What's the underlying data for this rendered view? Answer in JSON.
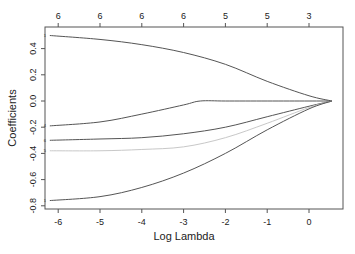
{
  "chart_data": {
    "type": "line",
    "title": "",
    "xlabel": "Log Lambda",
    "ylabel": "Coefficients",
    "xlim": [
      -6.3,
      0.8
    ],
    "ylim": [
      -0.82,
      0.57
    ],
    "grid": false,
    "legend": null,
    "x_ticks": [
      -6,
      -5,
      -4,
      -3,
      -2,
      -1,
      0
    ],
    "x_tick_labels": [
      "-6",
      "-5",
      "-4",
      "-3",
      "-2",
      "-1",
      "0"
    ],
    "y_ticks": [
      -0.8,
      -0.6,
      -0.4,
      -0.2,
      0.0,
      0.2,
      0.4
    ],
    "y_tick_labels": [
      "-0.8",
      "-0.6",
      "-0.4",
      "-0.2",
      "0.0",
      "0.2",
      "0.4"
    ],
    "top_axis": {
      "positions": [
        -6,
        -5,
        -4,
        -3,
        -2,
        -1,
        0
      ],
      "labels": [
        "6",
        "6",
        "6",
        "6",
        "5",
        "5",
        "3"
      ],
      "meaning": "number of nonzero coefficients"
    },
    "series": [
      {
        "name": "1",
        "color": "#555555",
        "x": [
          -6.2,
          -5,
          -4,
          -3,
          -2,
          -1,
          0,
          0.55
        ],
        "values": [
          0.5,
          0.47,
          0.43,
          0.37,
          0.28,
          0.15,
          0.04,
          0.0
        ]
      },
      {
        "name": "4",
        "color": "#555555",
        "x": [
          -6.2,
          -5,
          -4,
          -3,
          -2.6,
          -2,
          -1,
          0,
          0.55
        ],
        "values": [
          -0.19,
          -0.16,
          -0.1,
          -0.03,
          0.0,
          0.0,
          0.0,
          0.0,
          0.0
        ]
      },
      {
        "name": "6",
        "color": "#555555",
        "x": [
          -6.2,
          -5,
          -4,
          -3,
          -2,
          -1,
          0,
          0.55
        ],
        "values": [
          -0.3,
          -0.29,
          -0.28,
          -0.25,
          -0.2,
          -0.12,
          -0.04,
          0.0
        ]
      },
      {
        "name": "5",
        "color": "#c8c8c8",
        "x": [
          -6.2,
          -5,
          -4,
          -3,
          -2,
          -1,
          0,
          0.55
        ],
        "values": [
          -0.38,
          -0.38,
          -0.37,
          -0.35,
          -0.28,
          -0.17,
          -0.05,
          0.0
        ]
      },
      {
        "name": "1",
        "color": "#555555",
        "x": [
          -6.2,
          -5,
          -4,
          -3,
          -2,
          -1,
          0,
          0.55
        ],
        "values": [
          -0.76,
          -0.73,
          -0.66,
          -0.55,
          -0.4,
          -0.22,
          -0.06,
          0.0
        ]
      }
    ]
  },
  "layout": {
    "plot_box": {
      "left": 45,
      "right": 343,
      "top": 27,
      "bottom": 209
    },
    "x_px_per_unit": 41.8,
    "x_px_at_zero": 309,
    "y_px_at_zero": 101,
    "y_px_per_unit": 131
  }
}
